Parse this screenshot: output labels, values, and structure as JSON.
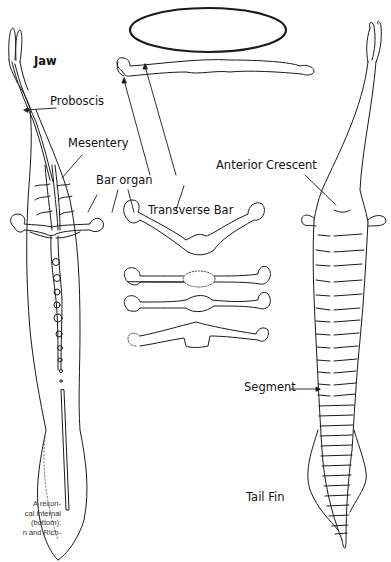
{
  "figure": {
    "labels": {
      "jaw": "Jaw",
      "proboscis": "Proboscis",
      "mesentery": "Mesentery",
      "bar_organ": "Bar organ",
      "transverse_bar": "Transverse Bar",
      "anterior_crescent": "Anterior Crescent",
      "segment": "Segment",
      "tail_fin": "Tail Fin"
    },
    "caption_fragment": [
      "A recon-",
      "cal internal",
      "(bottom):",
      "n and Rich-"
    ],
    "colors": {
      "line": "#1a1a1a",
      "background": "#ffffff"
    }
  }
}
